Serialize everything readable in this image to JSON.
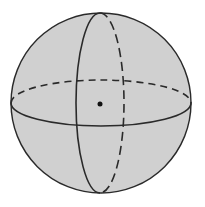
{
  "diagram": {
    "title": "",
    "colors": {
      "background": "#ffffff",
      "sphere_fill": "#d0d0d0",
      "stroke": "#2a2a2a",
      "center_dot": "#111111"
    },
    "sphere": {
      "cx": 101,
      "cy": 103,
      "r": 90
    },
    "equator": {
      "cx": 101,
      "cy": 103,
      "rx": 90,
      "ry": 23
    },
    "meridian": {
      "cx": 100,
      "cy": 103,
      "rx": 24,
      "ry": 90
    },
    "center_point": {
      "cx": 100,
      "cy": 104,
      "r": 2.5
    },
    "labels": []
  }
}
